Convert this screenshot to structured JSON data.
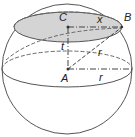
{
  "diagram": {
    "labels": {
      "C": "C",
      "x": "x",
      "B": "B",
      "t": "t",
      "r_slant": "r",
      "A": "A",
      "r_horizontal": "r"
    },
    "colors": {
      "stroke": "#555555",
      "cap_fill": "#d4d4d4",
      "background": "#ffffff"
    }
  }
}
